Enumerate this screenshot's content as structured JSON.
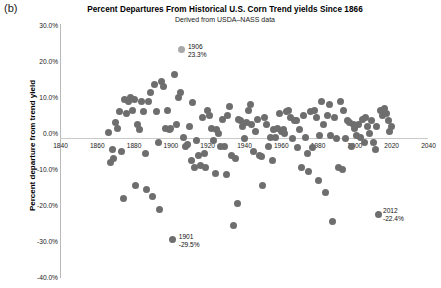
{
  "panel": {
    "label": "(b)"
  },
  "chart_data": {
    "type": "scatter",
    "title": "Percent Departures From Historical U.S. Corn Trend yields Since 1866",
    "subtitle": "Derived from USDA–NASS data",
    "xlabel": "",
    "ylabel": "Percent departure from trend yield",
    "xlim": [
      1840,
      2040
    ],
    "ylim": [
      -40,
      30
    ],
    "grid": false,
    "legend": null,
    "xticks": [
      1840,
      1860,
      1880,
      1900,
      1920,
      1940,
      1960,
      1980,
      2000,
      2020,
      2040
    ],
    "xtick_labels": [
      "1840",
      "1860",
      "1880",
      "1900",
      "1920",
      "1940",
      "1960",
      "1980",
      "2000",
      "2020",
      "2040"
    ],
    "yticks": [
      30,
      20,
      10,
      0,
      -10,
      -20,
      -30,
      -40
    ],
    "ytick_labels": [
      "30.0%",
      "20.0%",
      "10.0%",
      "0.0%",
      "-10.0%",
      "-20.0%",
      "-30.0%",
      "-40.0%"
    ],
    "marker_color": "#6e6e6e",
    "highlight_color": "#a8a8a8",
    "annotations": [
      {
        "year": 1906,
        "value": 23.3,
        "line1": "1906",
        "line2": "23.3%",
        "highlight": true
      },
      {
        "year": 1901,
        "value": -29.5,
        "line1": "1901",
        "line2": "-29.5%",
        "highlight": false
      },
      {
        "year": 2012,
        "value": -22.4,
        "line1": "2012",
        "line2": "-22.4%",
        "highlight": false
      }
    ],
    "x": [
      1866,
      1867,
      1868,
      1869,
      1870,
      1871,
      1872,
      1873,
      1874,
      1875,
      1876,
      1877,
      1878,
      1879,
      1880,
      1881,
      1882,
      1883,
      1884,
      1885,
      1886,
      1887,
      1888,
      1889,
      1890,
      1891,
      1892,
      1893,
      1894,
      1895,
      1896,
      1897,
      1898,
      1899,
      1900,
      1901,
      1902,
      1903,
      1904,
      1905,
      1906,
      1907,
      1908,
      1909,
      1910,
      1911,
      1912,
      1913,
      1914,
      1915,
      1916,
      1917,
      1918,
      1919,
      1920,
      1921,
      1922,
      1923,
      1924,
      1925,
      1926,
      1927,
      1928,
      1929,
      1930,
      1931,
      1932,
      1933,
      1934,
      1935,
      1936,
      1937,
      1938,
      1939,
      1940,
      1941,
      1942,
      1943,
      1944,
      1945,
      1946,
      1947,
      1948,
      1949,
      1950,
      1951,
      1952,
      1953,
      1954,
      1955,
      1956,
      1957,
      1958,
      1959,
      1960,
      1961,
      1962,
      1963,
      1964,
      1965,
      1966,
      1967,
      1968,
      1969,
      1970,
      1971,
      1972,
      1973,
      1974,
      1975,
      1976,
      1977,
      1978,
      1979,
      1980,
      1981,
      1982,
      1983,
      1984,
      1985,
      1986,
      1987,
      1988,
      1989,
      1990,
      1991,
      1992,
      1993,
      1994,
      1995,
      1996,
      1997,
      1998,
      1999,
      2000,
      2001,
      2002,
      2003,
      2004,
      2005,
      2006,
      2007,
      2008,
      2009,
      2010,
      2011,
      2012,
      2013,
      2014,
      2015,
      2016,
      2017,
      2018,
      2019,
      2020
    ],
    "y": [
      0.4,
      -8.0,
      -4.5,
      -7.0,
      3.0,
      1.5,
      6.0,
      -5.0,
      -18.0,
      9.5,
      5.5,
      9.0,
      10.0,
      6.5,
      9.5,
      -14.5,
      2.5,
      1.0,
      9.0,
      6.0,
      -5.5,
      -15.5,
      9.0,
      11.5,
      -17.5,
      13.5,
      6.0,
      -2.5,
      -21.0,
      14.5,
      13.0,
      1.5,
      6.5,
      1.0,
      1.5,
      -29.5,
      16.5,
      2.5,
      10.0,
      11.5,
      23.3,
      -1.0,
      -3.5,
      -3.0,
      2.0,
      -7.5,
      8.5,
      -9.5,
      -2.0,
      -6.0,
      -9.0,
      4.5,
      -5.5,
      -9.5,
      6.5,
      5.0,
      1.5,
      -2.0,
      -11.0,
      1.0,
      0.0,
      -3.5,
      4.0,
      -3.5,
      -11.5,
      5.0,
      7.5,
      -6.0,
      -25.5,
      -7.0,
      -19.5,
      4.0,
      3.5,
      2.0,
      -1.5,
      3.0,
      6.5,
      8.0,
      2.5,
      -5.0,
      0.5,
      4.0,
      -6.0,
      -6.5,
      -14.5,
      4.5,
      2.5,
      -3.5,
      -1.0,
      -7.5,
      1.0,
      -1.0,
      1.5,
      5.5,
      0.5,
      1.0,
      0.0,
      6.0,
      6.5,
      4.5,
      -1.5,
      3.5,
      3.5,
      -4.0,
      1.0,
      -9.5,
      5.0,
      -1.0,
      -5.5,
      -10.5,
      6.0,
      -4.0,
      6.5,
      4.5,
      -13.0,
      -0.5,
      9.0,
      2.5,
      -16.5,
      5.0,
      8.0,
      -0.5,
      -24.5,
      4.5,
      -1.5,
      -9.5,
      9.0,
      -10.0,
      6.5,
      -1.5,
      3.5,
      3.0,
      -3.5,
      2.5,
      1.5,
      -0.5,
      2.5,
      -1.0,
      4.0,
      -2.5,
      4.5,
      2.0,
      0.0,
      3.5,
      -2.5,
      -4.5,
      2.0,
      -22.4,
      6.5,
      5.0,
      7.0,
      5.5,
      3.5,
      0.5,
      2.0,
      4.5
    ]
  }
}
